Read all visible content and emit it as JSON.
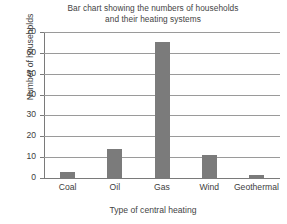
{
  "chart_data": {
    "type": "bar",
    "title": "Bar chart showing the numbers of households and their heating systems",
    "title_lines": [
      "Bar chart showing the numbers of households",
      "and their heating systems"
    ],
    "xlabel": "Type of central heating",
    "ylabel": "Number of households",
    "categories": [
      "Coal",
      "Oil",
      "Gas",
      "Wind",
      "Geothermal"
    ],
    "values": [
      3,
      14,
      65,
      11,
      1.5
    ],
    "ylim": [
      0,
      70
    ],
    "ytick_values": [
      0,
      10,
      20,
      30,
      40,
      50,
      60,
      70
    ],
    "ytick_labels": [
      "0",
      "10",
      "20",
      "30",
      "40",
      "50",
      "60",
      "70"
    ],
    "grid": true,
    "grid_axis": "y",
    "legend": null,
    "bar_color": "#7b7b7b",
    "axis_color": "#7a7a7a",
    "grid_color": "#9a9a9a",
    "background_color": "#ffffff",
    "text_color": "#3d3d3d"
  }
}
